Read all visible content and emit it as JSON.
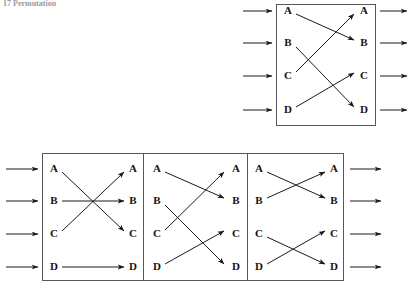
{
  "figure": {
    "caption": "17  Permutation",
    "node_labels": [
      "A",
      "B",
      "C",
      "D"
    ],
    "colors": {
      "ink": "#1a1a1a",
      "box_stroke": "#55585c",
      "background": "#ffffff",
      "caption": "#9a9a9a"
    }
  },
  "diagrams": [
    {
      "id": "composite-permutation",
      "name": "Composite permutation",
      "position": "top-right",
      "inputs": [
        "A",
        "B",
        "C",
        "D"
      ],
      "outputs": [
        "A",
        "B",
        "C",
        "D"
      ],
      "mapping": [
        {
          "from": "A",
          "to": "B"
        },
        {
          "from": "B",
          "to": "D"
        },
        {
          "from": "C",
          "to": "A"
        },
        {
          "from": "D",
          "to": "C"
        }
      ],
      "cycle_notation": "(A B D C)"
    },
    {
      "id": "factor-1",
      "name": "Permutation factor 1",
      "position": "bottom-left",
      "inputs": [
        "A",
        "B",
        "C",
        "D"
      ],
      "outputs": [
        "A",
        "B",
        "C",
        "D"
      ],
      "mapping": [
        {
          "from": "A",
          "to": "C"
        },
        {
          "from": "B",
          "to": "B"
        },
        {
          "from": "C",
          "to": "A"
        },
        {
          "from": "D",
          "to": "D"
        }
      ],
      "cycle_notation": "(A C)"
    },
    {
      "id": "factor-2",
      "name": "Permutation factor 2",
      "position": "bottom-middle",
      "inputs": [
        "A",
        "B",
        "C",
        "D"
      ],
      "outputs": [
        "A",
        "B",
        "C",
        "D"
      ],
      "mapping": [
        {
          "from": "A",
          "to": "B"
        },
        {
          "from": "B",
          "to": "D"
        },
        {
          "from": "C",
          "to": "A"
        },
        {
          "from": "D",
          "to": "C"
        }
      ],
      "cycle_notation": "(A B D C)"
    },
    {
      "id": "factor-3",
      "name": "Permutation factor 3",
      "position": "bottom-right",
      "inputs": [
        "A",
        "B",
        "C",
        "D"
      ],
      "outputs": [
        "A",
        "B",
        "C",
        "D"
      ],
      "mapping": [
        {
          "from": "A",
          "to": "B"
        },
        {
          "from": "B",
          "to": "A"
        },
        {
          "from": "C",
          "to": "D"
        },
        {
          "from": "D",
          "to": "C"
        }
      ],
      "cycle_notation": "(A B)(C D)"
    }
  ]
}
